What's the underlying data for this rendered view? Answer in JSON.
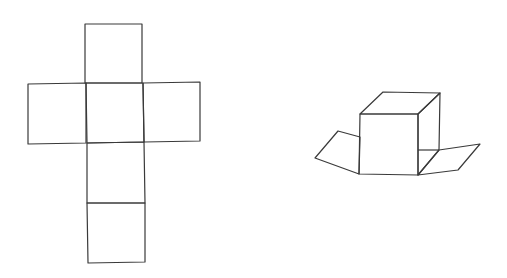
{
  "diagram": {
    "stroke_color": "#3a3a3a",
    "background": "#ffffff",
    "net": {
      "faces": [
        {
          "name": "top",
          "points": "85,24 142,24 142,83 85,83"
        },
        {
          "name": "left",
          "points": "28,84 86,83 86,143 28,144"
        },
        {
          "name": "center",
          "points": "86,83 143,83 144,142 87,143"
        },
        {
          "name": "right",
          "points": "143,83 200,82 200,141 144,142"
        },
        {
          "name": "below-center",
          "points": "87,143 144,142 145,203 87,203"
        },
        {
          "name": "bottom",
          "points": "87,203 145,203 145,262 88,263"
        }
      ]
    },
    "folded_cube": {
      "faces": [
        {
          "name": "front",
          "points": "360,114 418,114 418,175 359,174"
        },
        {
          "name": "top",
          "points": "360,114 383,92 440,93 418,114"
        },
        {
          "name": "right-side",
          "points": "418,114 440,93 439,150 418,175"
        },
        {
          "name": "left-flap",
          "points": "360,137 338,131 315,158 359,174"
        },
        {
          "name": "right-flap",
          "points": "418,175 439,150 480,144 458,170"
        },
        {
          "name": "right-side-base",
          "points": "418,150 439,150"
        }
      ]
    }
  }
}
